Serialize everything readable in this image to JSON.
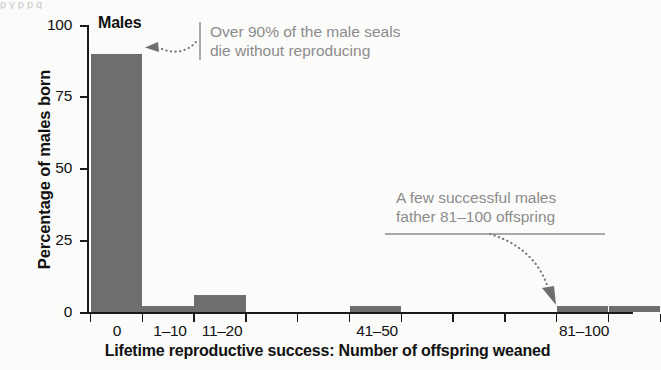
{
  "page": {
    "top_bleed_text": "p y p p g"
  },
  "chart_data": {
    "type": "bar",
    "title": "Males",
    "xlabel": "Lifetime reproductive success: Number of offspring weaned",
    "ylabel": "Percentage of males born",
    "categories": [
      "0",
      "1–10",
      "11–20",
      "21–30",
      "31–40",
      "41–50",
      "51–60",
      "61–70",
      "71–80",
      "81–90",
      "91–100"
    ],
    "tick_labels": [
      "0",
      "1–10",
      "11–20",
      "41–50",
      "81–100"
    ],
    "values": [
      90,
      2,
      6,
      0,
      0,
      2,
      0,
      0,
      0,
      2,
      2
    ],
    "ylim": [
      0,
      100
    ],
    "yticks": [
      "0",
      "25",
      "50",
      "75",
      "100"
    ],
    "grid": false,
    "legend": "none",
    "bar_color": "#6e6e6e",
    "axis_color": "#1a1a1a",
    "annotation_color": "#8c8c8c"
  },
  "annotations": {
    "first": {
      "line1": "Over 90% of the male seals",
      "line2": "die without reproducing"
    },
    "second": {
      "line1": "A few successful males",
      "line2": "father 81–100 offspring"
    }
  }
}
